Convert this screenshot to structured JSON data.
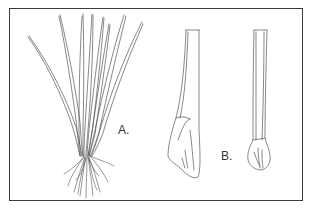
{
  "figure": {
    "labels": {
      "a": "A.",
      "b": "B."
    },
    "panels": [
      {
        "id": "A",
        "subject": "whole-plant-with-leaves-and-roots"
      },
      {
        "id": "B",
        "subject": "leaf-base-detail-views"
      }
    ],
    "colors": {
      "stroke": "#555555",
      "border": "#3a3a3a",
      "background": "#ffffff"
    }
  }
}
